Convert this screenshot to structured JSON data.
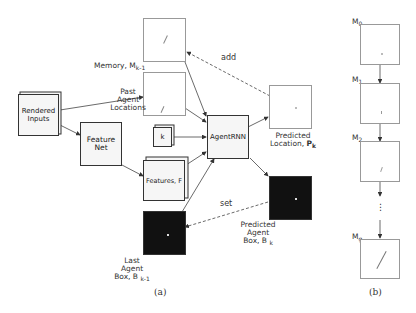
{
  "panel_a": {
    "caption": "(a)",
    "rendered_inputs": {
      "line1": "Rendered",
      "line2": "Inputs"
    },
    "feature_net": {
      "line1": "Feature",
      "line2": "Net"
    },
    "features": {
      "label": "Features, F"
    },
    "k_box": {
      "label": "k"
    },
    "agent_rnn": {
      "label": "AgentRNN"
    },
    "memory": {
      "label": "Memory, M",
      "sub": "k-1"
    },
    "past_locations": {
      "line1": "Past",
      "line2": "Agent",
      "line3": "Locations"
    },
    "predicted_location": {
      "line1": "Predicted",
      "line2": "Location,",
      "sym": "P",
      "sub": "k"
    },
    "predicted_box": {
      "line1": "Predicted",
      "line2": "Agent",
      "line3": "Box, B",
      "sub": "k"
    },
    "last_box": {
      "line1": "Last",
      "line2": "Agent",
      "line3": "Box, B",
      "sub": "k-1"
    },
    "edge_add": "add",
    "edge_set": "set"
  },
  "panel_b": {
    "caption": "(b)",
    "m0": {
      "label": "M",
      "sub": "0"
    },
    "m1": {
      "label": "M",
      "sub": "1"
    },
    "m2": {
      "label": "M",
      "sub": "2"
    },
    "mg": {
      "label": "M",
      "sub": "g"
    },
    "ellipsis": "⋮"
  }
}
